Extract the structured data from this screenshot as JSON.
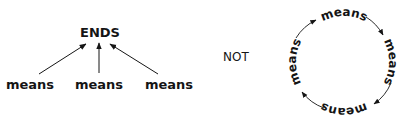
{
  "left_diagram": {
    "top_label": "ENDS",
    "bottom_labels": [
      "means",
      "means",
      "means"
    ]
  },
  "separator": "NOT",
  "right_diagram": {
    "labels": [
      "means",
      "means",
      "means",
      "means"
    ],
    "direction": "clockwise"
  },
  "colors": {
    "ink": "#151515",
    "background": "#ffffff"
  }
}
